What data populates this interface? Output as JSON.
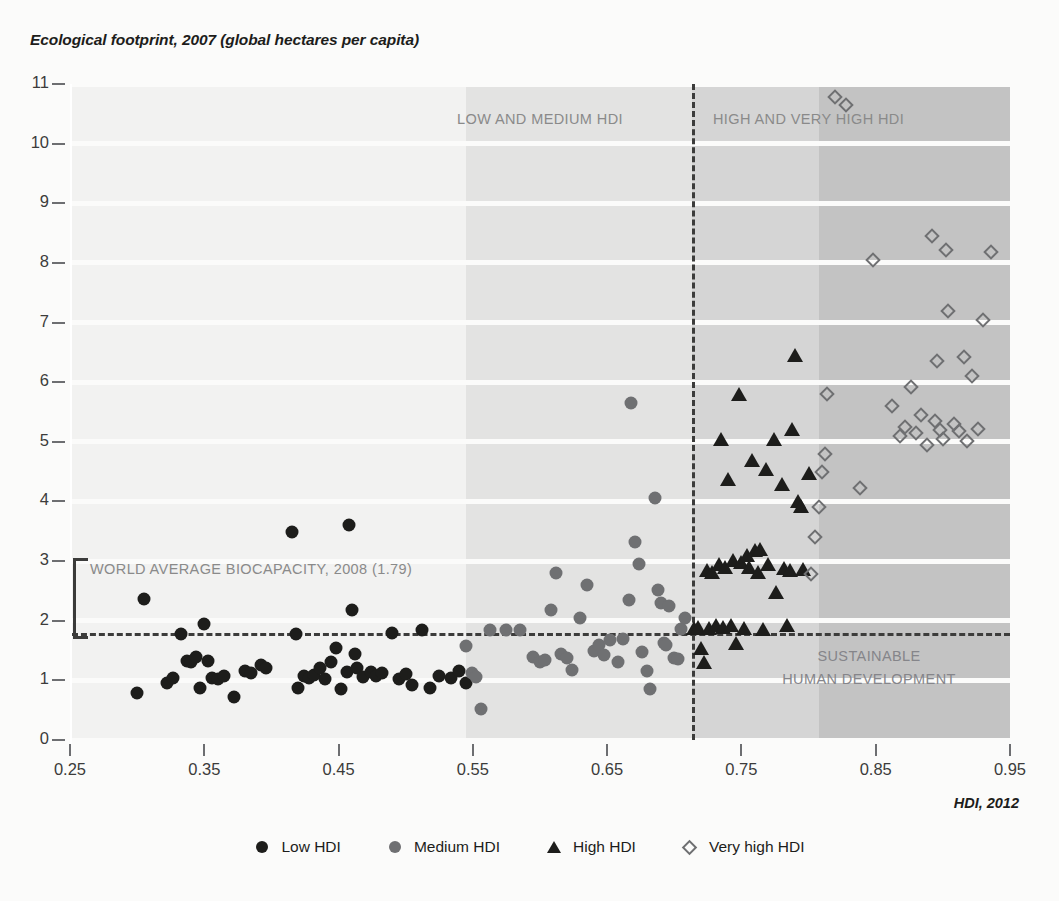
{
  "chart_data": {
    "type": "scatter",
    "title": "Ecological footprint, 2007 (global hectares per capita)",
    "xlabel": "HDI, 2012",
    "ylabel": "Ecological footprint, 2007 (global hectares per capita)",
    "xlim": [
      0.25,
      0.95
    ],
    "ylim": [
      0,
      11
    ],
    "xticks": [
      "0.25",
      "0.35",
      "0.45",
      "0.55",
      "0.65",
      "0.75",
      "0.85",
      "0.95"
    ],
    "xtick_values": [
      0.25,
      0.35,
      0.45,
      0.55,
      0.65,
      0.75,
      0.85,
      0.95
    ],
    "yticks": [
      "0",
      "1",
      "2",
      "3",
      "4",
      "5",
      "6",
      "7",
      "8",
      "9",
      "10",
      "11"
    ],
    "ytick_values": [
      0,
      1,
      2,
      3,
      4,
      5,
      6,
      7,
      8,
      9,
      10,
      11
    ],
    "grid": "horizontal white bands on shaded background",
    "legend_position": "bottom-center",
    "reference_lines": {
      "horizontal": {
        "label": "WORLD AVERAGE BIOCAPACITY, 2008 (1.79)",
        "value": 1.79,
        "style": "dashed"
      },
      "vertical": {
        "label": "HDI threshold between medium and high HDI",
        "value": 0.713,
        "style": "dashed"
      }
    },
    "annotations": [
      {
        "text": "LOW AND MEDIUM HDI",
        "x": 0.6,
        "y": 10.4
      },
      {
        "text": "HIGH AND VERY HIGH HDI",
        "x": 0.8,
        "y": 10.4
      },
      {
        "text": "WORLD AVERAGE BIOCAPACITY, 2008 (1.79)",
        "x": 0.285,
        "y": 2.85
      },
      {
        "text": "SUSTAINABLE",
        "x": 0.845,
        "y": 1.4
      },
      {
        "text": "HUMAN DEVELOPMENT",
        "x": 0.845,
        "y": 1.0
      }
    ],
    "shaded_bands": [
      {
        "from": 0.25,
        "to": 0.545,
        "shade": "#f2f2f1"
      },
      {
        "from": 0.545,
        "to": 0.713,
        "shade": "#e3e3e2"
      },
      {
        "from": 0.713,
        "to": 0.808,
        "shade": "#d5d5d5"
      },
      {
        "from": 0.808,
        "to": 0.95,
        "shade": "#c3c3c3"
      }
    ],
    "series": [
      {
        "name": "Low HDI",
        "marker": "filled-circle",
        "color": "#1d1d1b",
        "points": [
          [
            0.3,
            0.78
          ],
          [
            0.305,
            2.36
          ],
          [
            0.322,
            0.95
          ],
          [
            0.327,
            1.04
          ],
          [
            0.333,
            1.77
          ],
          [
            0.337,
            1.33
          ],
          [
            0.34,
            1.3
          ],
          [
            0.344,
            1.4
          ],
          [
            0.347,
            0.88
          ],
          [
            0.35,
            1.95
          ],
          [
            0.353,
            1.32
          ],
          [
            0.356,
            1.04
          ],
          [
            0.36,
            1.02
          ],
          [
            0.365,
            1.08
          ],
          [
            0.372,
            0.72
          ],
          [
            0.38,
            1.15
          ],
          [
            0.385,
            1.12
          ],
          [
            0.392,
            1.25
          ],
          [
            0.396,
            1.2
          ],
          [
            0.415,
            3.48
          ],
          [
            0.418,
            1.77
          ],
          [
            0.42,
            0.87
          ],
          [
            0.424,
            1.08
          ],
          [
            0.428,
            1.04
          ],
          [
            0.432,
            1.09
          ],
          [
            0.436,
            1.2
          ],
          [
            0.44,
            1.03
          ],
          [
            0.444,
            1.3
          ],
          [
            0.448,
            1.55
          ],
          [
            0.452,
            0.85
          ],
          [
            0.456,
            1.14
          ],
          [
            0.458,
            3.6
          ],
          [
            0.46,
            2.18
          ],
          [
            0.462,
            1.45
          ],
          [
            0.464,
            1.2
          ],
          [
            0.468,
            1.05
          ],
          [
            0.474,
            1.14
          ],
          [
            0.478,
            1.08
          ],
          [
            0.482,
            1.12
          ],
          [
            0.49,
            1.8
          ],
          [
            0.495,
            1.03
          ],
          [
            0.5,
            1.1
          ],
          [
            0.505,
            0.93
          ],
          [
            0.512,
            1.85
          ],
          [
            0.518,
            0.88
          ],
          [
            0.525,
            1.08
          ],
          [
            0.534,
            1.04
          ],
          [
            0.54,
            1.16
          ],
          [
            0.545,
            0.95
          ]
        ]
      },
      {
        "name": "Medium HDI",
        "marker": "filled-circle",
        "color": "#6f7072",
        "points": [
          [
            0.545,
            1.57
          ],
          [
            0.549,
            1.12
          ],
          [
            0.552,
            1.05
          ],
          [
            0.556,
            0.52
          ],
          [
            0.563,
            1.85
          ],
          [
            0.575,
            1.85
          ],
          [
            0.585,
            1.84
          ],
          [
            0.595,
            1.4
          ],
          [
            0.6,
            1.3
          ],
          [
            0.604,
            1.34
          ],
          [
            0.608,
            2.18
          ],
          [
            0.612,
            2.8
          ],
          [
            0.616,
            1.45
          ],
          [
            0.62,
            1.38
          ],
          [
            0.624,
            1.18
          ],
          [
            0.63,
            2.05
          ],
          [
            0.635,
            2.6
          ],
          [
            0.64,
            1.5
          ],
          [
            0.644,
            1.6
          ],
          [
            0.648,
            1.42
          ],
          [
            0.652,
            1.68
          ],
          [
            0.658,
            1.3
          ],
          [
            0.662,
            1.7
          ],
          [
            0.666,
            2.35
          ],
          [
            0.668,
            5.65
          ],
          [
            0.671,
            3.32
          ],
          [
            0.674,
            2.95
          ],
          [
            0.676,
            1.48
          ],
          [
            0.68,
            1.15
          ],
          [
            0.682,
            0.85
          ],
          [
            0.686,
            4.05
          ],
          [
            0.688,
            2.52
          ],
          [
            0.69,
            2.3
          ],
          [
            0.692,
            1.62
          ],
          [
            0.694,
            1.6
          ],
          [
            0.696,
            2.25
          ],
          [
            0.7,
            1.38
          ],
          [
            0.703,
            1.35
          ],
          [
            0.705,
            1.86
          ],
          [
            0.708,
            2.05
          ]
        ]
      },
      {
        "name": "High HDI",
        "marker": "filled-triangle",
        "color": "#1d1d1b",
        "points": [
          [
            0.715,
            1.88
          ],
          [
            0.718,
            1.9
          ],
          [
            0.72,
            1.55
          ],
          [
            0.722,
            1.3
          ],
          [
            0.724,
            2.85
          ],
          [
            0.726,
            1.88
          ],
          [
            0.728,
            2.82
          ],
          [
            0.731,
            1.92
          ],
          [
            0.733,
            2.95
          ],
          [
            0.735,
            5.05
          ],
          [
            0.736,
            1.9
          ],
          [
            0.738,
            2.9
          ],
          [
            0.74,
            4.38
          ],
          [
            0.742,
            1.93
          ],
          [
            0.744,
            3.02
          ],
          [
            0.746,
            1.62
          ],
          [
            0.748,
            5.8
          ],
          [
            0.75,
            2.98
          ],
          [
            0.752,
            1.88
          ],
          [
            0.754,
            3.1
          ],
          [
            0.756,
            2.9
          ],
          [
            0.758,
            4.7
          ],
          [
            0.76,
            3.18
          ],
          [
            0.762,
            2.82
          ],
          [
            0.764,
            3.2
          ],
          [
            0.766,
            1.86
          ],
          [
            0.768,
            4.55
          ],
          [
            0.77,
            2.95
          ],
          [
            0.774,
            5.05
          ],
          [
            0.776,
            2.48
          ],
          [
            0.78,
            4.3
          ],
          [
            0.782,
            2.88
          ],
          [
            0.784,
            1.92
          ],
          [
            0.786,
            2.85
          ],
          [
            0.788,
            5.22
          ],
          [
            0.79,
            6.45
          ],
          [
            0.792,
            4.0
          ],
          [
            0.794,
            3.92
          ],
          [
            0.796,
            2.86
          ],
          [
            0.8,
            4.48
          ]
        ]
      },
      {
        "name": "Very high HDI",
        "marker": "open-diamond",
        "color": "#6f7072",
        "points": [
          [
            0.802,
            2.78
          ],
          [
            0.805,
            3.4
          ],
          [
            0.808,
            3.9
          ],
          [
            0.81,
            4.5
          ],
          [
            0.812,
            4.8
          ],
          [
            0.814,
            5.8
          ],
          [
            0.82,
            10.78
          ],
          [
            0.828,
            10.65
          ],
          [
            0.838,
            4.22
          ],
          [
            0.848,
            8.05
          ],
          [
            0.862,
            5.6
          ],
          [
            0.868,
            5.1
          ],
          [
            0.872,
            5.25
          ],
          [
            0.876,
            5.92
          ],
          [
            0.88,
            5.15
          ],
          [
            0.884,
            5.45
          ],
          [
            0.888,
            4.95
          ],
          [
            0.892,
            8.45
          ],
          [
            0.894,
            5.35
          ],
          [
            0.896,
            6.35
          ],
          [
            0.898,
            5.2
          ],
          [
            0.9,
            5.05
          ],
          [
            0.902,
            8.22
          ],
          [
            0.904,
            7.2
          ],
          [
            0.908,
            5.3
          ],
          [
            0.912,
            5.18
          ],
          [
            0.916,
            6.42
          ],
          [
            0.918,
            5.02
          ],
          [
            0.922,
            6.1
          ],
          [
            0.926,
            5.22
          ],
          [
            0.93,
            7.05
          ],
          [
            0.936,
            8.18
          ]
        ]
      }
    ]
  },
  "legend": {
    "items": [
      {
        "label": "Low HDI",
        "marker": "circle-dark"
      },
      {
        "label": "Medium HDI",
        "marker": "circle-gray"
      },
      {
        "label": "High HDI",
        "marker": "triangle-dark"
      },
      {
        "label": "Very high HDI",
        "marker": "diamond-open"
      }
    ]
  },
  "colors": {
    "text": "#1d1d1b",
    "annotation": "#8a8a8a",
    "low": "#1d1d1b",
    "medium": "#6f7072",
    "high": "#1d1d1b",
    "veryhigh": "#6f7072",
    "background": "#fbfbfa"
  }
}
